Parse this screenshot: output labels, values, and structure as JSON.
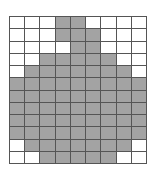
{
  "grid": {
    "columns": 9,
    "rows": 12,
    "fill_color": "#a3a3a3",
    "empty_color": "#ffffff",
    "line_color": "#555555",
    "cells": [
      [
        0,
        0,
        0,
        1,
        1,
        0,
        0,
        0,
        0
      ],
      [
        0,
        0,
        0,
        1,
        1,
        1,
        0,
        0,
        0
      ],
      [
        0,
        0,
        0,
        0,
        1,
        1,
        0,
        0,
        0
      ],
      [
        0,
        0,
        1,
        1,
        1,
        1,
        1,
        0,
        0
      ],
      [
        0,
        1,
        1,
        1,
        1,
        1,
        1,
        1,
        0
      ],
      [
        1,
        1,
        1,
        1,
        1,
        1,
        1,
        1,
        1
      ],
      [
        1,
        1,
        1,
        1,
        1,
        1,
        1,
        1,
        1
      ],
      [
        1,
        1,
        1,
        1,
        1,
        1,
        1,
        1,
        1
      ],
      [
        1,
        1,
        1,
        1,
        1,
        1,
        1,
        1,
        1
      ],
      [
        1,
        1,
        1,
        1,
        1,
        1,
        1,
        1,
        1
      ],
      [
        0,
        1,
        1,
        1,
        1,
        1,
        1,
        1,
        0
      ],
      [
        0,
        0,
        1,
        1,
        1,
        1,
        1,
        0,
        0
      ]
    ]
  }
}
